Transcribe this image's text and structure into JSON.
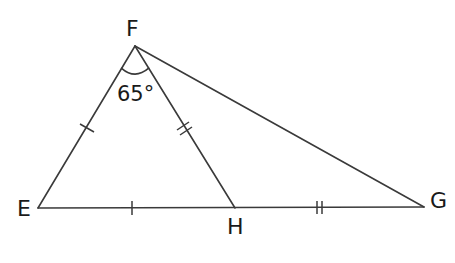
{
  "diagram": {
    "type": "geometry-triangle",
    "points": {
      "F": {
        "label": "F",
        "x": 135,
        "y": 46
      },
      "E": {
        "label": "E",
        "x": 38,
        "y": 208
      },
      "H": {
        "label": "H",
        "x": 235,
        "y": 208
      },
      "G": {
        "label": "G",
        "x": 424,
        "y": 207
      }
    },
    "segments": [
      {
        "from": "F",
        "to": "E",
        "ticks": 1
      },
      {
        "from": "F",
        "to": "H",
        "ticks": 2
      },
      {
        "from": "F",
        "to": "G",
        "ticks": 0
      },
      {
        "from": "E",
        "to": "H",
        "ticks": 1
      },
      {
        "from": "H",
        "to": "G",
        "ticks": 2
      }
    ],
    "angle": {
      "vertex": "F",
      "between": [
        "E",
        "H"
      ],
      "label": "65°"
    }
  }
}
